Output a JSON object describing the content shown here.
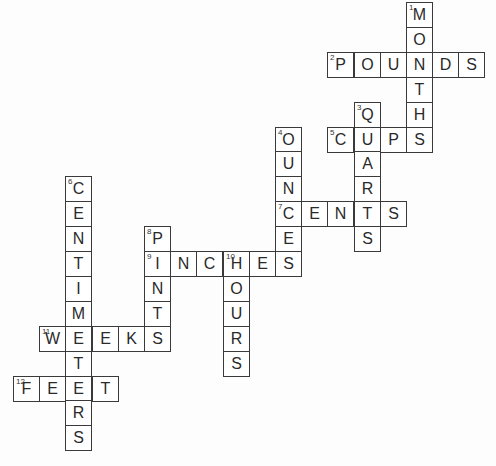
{
  "puzzle": {
    "type": "crossword",
    "grid": {
      "origin_x": 13,
      "origin_y": 2,
      "cell_w": 26.2,
      "cell_h": 24.9
    },
    "colors": {
      "border": "#3a3a3a",
      "text": "#2a2a2a",
      "background": "#ffffff"
    },
    "words": [
      {
        "number": 1,
        "answer": "MONTHS",
        "col": 15,
        "row": 0,
        "direction": "down"
      },
      {
        "number": 2,
        "answer": "POUNDS",
        "col": 12,
        "row": 2,
        "direction": "across"
      },
      {
        "number": 3,
        "answer": "QUARTS",
        "col": 13,
        "row": 4,
        "direction": "down"
      },
      {
        "number": 4,
        "answer": "OUNCES",
        "col": 10,
        "row": 5,
        "direction": "down"
      },
      {
        "number": 5,
        "answer": "CUPS",
        "col": 12,
        "row": 5,
        "direction": "across"
      },
      {
        "number": 6,
        "answer": "CENTIMETERS",
        "col": 2,
        "row": 7,
        "direction": "down"
      },
      {
        "number": 7,
        "answer": "CENTS",
        "col": 10,
        "row": 8,
        "direction": "across"
      },
      {
        "number": 8,
        "answer": "PINTS",
        "col": 5,
        "row": 9,
        "direction": "down"
      },
      {
        "number": 9,
        "answer": "INCHES",
        "col": 5,
        "row": 10,
        "direction": "across"
      },
      {
        "number": 10,
        "answer": "HOURS",
        "col": 8,
        "row": 10,
        "direction": "down"
      },
      {
        "number": 11,
        "answer": "WEEKS",
        "col": 1,
        "row": 13,
        "direction": "across"
      },
      {
        "number": 12,
        "answer": "FEET",
        "col": 0,
        "row": 15,
        "direction": "across"
      }
    ]
  }
}
